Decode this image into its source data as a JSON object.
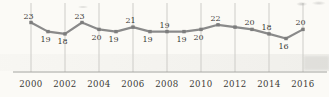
{
  "colors": {
    "background": "#fbfaf6",
    "line": "#8a8a8a",
    "marker": "#7d7d7d",
    "gridline": "#cdccc8",
    "axis": "#a4a39f",
    "text": "#3b3a37"
  },
  "chart_data": {
    "type": "line",
    "title": "",
    "x": [
      2000,
      2001,
      2002,
      2003,
      2004,
      2005,
      2006,
      2007,
      2008,
      2009,
      2010,
      2011,
      2012,
      2013,
      2014,
      2015,
      2016
    ],
    "values": [
      23,
      19,
      18,
      23,
      20,
      19,
      21,
      19,
      19,
      19,
      20,
      22,
      21,
      20,
      18,
      16,
      20
    ],
    "data_labels": [
      "23",
      "19",
      "18",
      "23",
      "20",
      "19",
      "21",
      "19",
      "19",
      "19",
      "20",
      "22",
      "",
      "20",
      "18",
      "16",
      "20"
    ],
    "data_label_positions": [
      "above",
      "below",
      "below",
      "above",
      "below",
      "below",
      "above",
      "below",
      "above",
      "below",
      "below",
      "above",
      "none",
      "above",
      "above",
      "below",
      "above"
    ],
    "x_tick_labels": [
      "2000",
      "2002",
      "2004",
      "2006",
      "2008",
      "2010",
      "2012",
      "2014",
      "2016"
    ],
    "x_tick_years": [
      2000,
      2002,
      2004,
      2006,
      2008,
      2010,
      2012,
      2014,
      2016
    ],
    "ylim": [
      14,
      26
    ],
    "xlabel": "",
    "ylabel": "",
    "grid": "vertical",
    "legend": "none",
    "markers": "square"
  }
}
